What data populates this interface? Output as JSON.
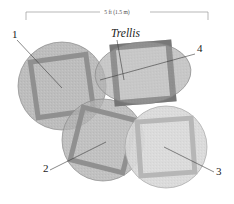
{
  "diagram": {
    "dimension": {
      "label": "5 ft (1.5 m)",
      "bracket_left_x": 26,
      "bracket_right_x": 208,
      "bracket_y": 12,
      "tick_drop": 8
    },
    "annotations": {
      "trellis_label": "Trellis"
    },
    "colors": {
      "background": "#ffffff",
      "bed_fill_medium": "#b2b2b2",
      "bed_fill_light": "#d8d8d8",
      "bed_stroke": "#8a8a8a",
      "frame_dark": "#8d8d8d",
      "frame_darker": "#6e6e6e",
      "frame_light": "#b4b4b4",
      "leader_line": "#3a3a3a",
      "dimension_line": "#9a9a9a",
      "text": "#1a1a1a"
    },
    "beds": [
      {
        "id": "bed-1",
        "label": "1",
        "shape": "circle",
        "cx": 62,
        "cy": 86,
        "rx": 44,
        "ry": 44,
        "rotation": 0,
        "fill": "#b2b2b2",
        "opacity": 0.85,
        "frame": {
          "size": 56,
          "thickness": 5,
          "rotation": -8,
          "color": "#8d8d8d"
        },
        "label_pos": {
          "x": 12,
          "y": 38
        },
        "leader": {
          "x1": 17,
          "y1": 40,
          "x2": 62,
          "y2": 88
        }
      },
      {
        "id": "bed-4",
        "label": "4",
        "shape": "ellipse",
        "cx": 143,
        "cy": 73,
        "rx": 48,
        "ry": 31,
        "rotation": -4,
        "fill": "#b2b2b2",
        "opacity": 0.85,
        "frame": {
          "size": 56,
          "thickness": 6,
          "rotation": -5,
          "color": "#6e6e6e"
        },
        "label_pos": {
          "x": 197,
          "y": 52
        },
        "leader": {
          "x1": 195,
          "y1": 54,
          "x2": 100,
          "y2": 80
        }
      },
      {
        "id": "bed-2",
        "label": "2",
        "shape": "circle",
        "cx": 103,
        "cy": 140,
        "rx": 41,
        "ry": 41,
        "rotation": 0,
        "fill": "#b2b2b2",
        "opacity": 0.82,
        "frame": {
          "size": 54,
          "thickness": 5,
          "rotation": 14,
          "color": "#8d8d8d"
        },
        "label_pos": {
          "x": 43,
          "y": 172
        },
        "leader": {
          "x1": 50,
          "y1": 170,
          "x2": 106,
          "y2": 142
        }
      },
      {
        "id": "bed-3",
        "label": "3",
        "shape": "circle",
        "cx": 166,
        "cy": 147,
        "rx": 41,
        "ry": 41,
        "rotation": 0,
        "fill": "#d8d8d8",
        "opacity": 0.9,
        "frame": {
          "size": 54,
          "thickness": 5,
          "rotation": -4,
          "color": "#b4b4b4"
        },
        "label_pos": {
          "x": 216,
          "y": 175
        },
        "leader": {
          "x1": 214,
          "y1": 172,
          "x2": 164,
          "y2": 147
        }
      }
    ],
    "trellis": {
      "label_pos": {
        "x": 111,
        "y": 37
      },
      "leader": {
        "x1": 117,
        "y1": 40,
        "x2": 124,
        "y2": 80
      }
    }
  }
}
